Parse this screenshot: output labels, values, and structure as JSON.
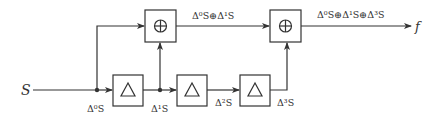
{
  "diagram": {
    "input_label": "S",
    "output_label": "f",
    "blocks": {
      "delay1": {
        "symbol": "Δ"
      },
      "delay2": {
        "symbol": "Δ"
      },
      "delay3": {
        "symbol": "Δ"
      },
      "sum1": {
        "symbol": "⊕"
      },
      "sum2": {
        "symbol": "⊕"
      }
    },
    "signals": {
      "d0": "Δ⁰S",
      "d1": "Δ¹S",
      "d2": "Δ²S",
      "d3": "Δ³S",
      "sum1_out": "Δ⁰S⊕Δ¹S",
      "sum2_out": "Δ⁰S⊕Δ¹S⊕Δ³S"
    },
    "colors": {
      "stroke": "#333333",
      "background": "#ffffff"
    }
  }
}
